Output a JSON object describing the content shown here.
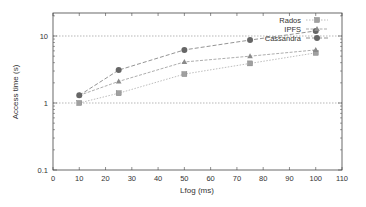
{
  "chart_data": {
    "type": "line",
    "title": "",
    "xlabel": "Lfog (ms)",
    "ylabel": "Access time (s)",
    "xlim": [
      0,
      110
    ],
    "ylim": [
      0.1,
      22
    ],
    "yscale": "log",
    "x_ticks": [
      0,
      10,
      20,
      30,
      40,
      50,
      60,
      70,
      80,
      90,
      100,
      110
    ],
    "y_ticks": [
      0.1,
      1,
      10
    ],
    "y_tick_labels": [
      "0.1",
      "1",
      "10"
    ],
    "grid": "horizontal dashed at 1 and 10",
    "legend_position": "top-right",
    "x": [
      10,
      25,
      50,
      75,
      100
    ],
    "series": [
      {
        "name": "Rados",
        "marker": "square",
        "color": "#a0a0a0",
        "values": [
          1.0,
          1.4,
          2.7,
          3.9,
          5.6
        ]
      },
      {
        "name": "IPFS",
        "marker": "triangle",
        "color": "#8a8a8a",
        "values": [
          1.3,
          2.1,
          4.1,
          5.0,
          6.2
        ]
      },
      {
        "name": "Cassandra",
        "marker": "circle",
        "color": "#666666",
        "values": [
          1.3,
          3.1,
          6.2,
          8.7,
          11.9
        ]
      }
    ]
  }
}
